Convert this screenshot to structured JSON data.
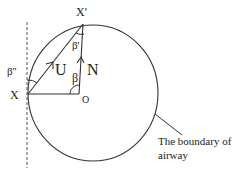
{
  "diagram": {
    "labels": {
      "x_prime": "X'",
      "x": "X",
      "o": "O",
      "u": "U",
      "n": "N",
      "beta": "β",
      "beta_prime": "β'",
      "beta_double_prime": "β''",
      "boundary_line1": "The boundary of",
      "boundary_line2": "airway"
    },
    "colors": {
      "stroke": "#333333",
      "text": "#222222"
    }
  }
}
